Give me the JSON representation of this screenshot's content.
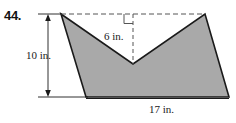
{
  "problem": {
    "number": "44."
  },
  "figure": {
    "name": "concave-chevron-polygon",
    "fill_color": "#a9a9a9",
    "stroke_color": "#1a1a1a",
    "dashed_color": "#4d4d4d",
    "dimensions": {
      "height": "10 in.",
      "notch_depth": "6 in.",
      "base": "17 in."
    },
    "vertices": [
      [
        61,
        14
      ],
      [
        133,
        64
      ],
      [
        205,
        14
      ],
      [
        229,
        97
      ],
      [
        86,
        97
      ]
    ],
    "dashed_top_line": [
      [
        61,
        14
      ],
      [
        205,
        14
      ]
    ],
    "dashed_notch_line": [
      [
        133,
        14
      ],
      [
        133,
        64
      ]
    ],
    "right_angle_marker": [
      [
        125,
        14
      ],
      [
        125,
        23
      ],
      [
        134,
        23
      ]
    ],
    "height_dimension_line": {
      "x": 48,
      "y_top": 14,
      "y_bottom": 97,
      "extension_top": [
        [
          38,
          14
        ],
        [
          61,
          14
        ]
      ],
      "extension_bottom": [
        [
          38,
          97
        ],
        [
          86,
          97
        ]
      ]
    },
    "base_line": [
      [
        86,
        99
      ],
      [
        229,
        99
      ]
    ]
  }
}
